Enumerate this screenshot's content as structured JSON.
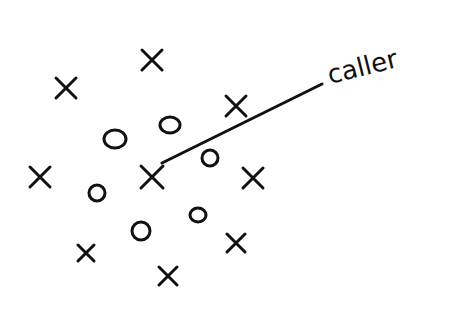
{
  "diagram": {
    "type": "hand-drawn play diagram",
    "label": "caller",
    "pointer_line": {
      "x1": 162,
      "y1": 163,
      "x2": 322,
      "y2": 84
    },
    "label_pos": {
      "x": 330,
      "y": 84,
      "rotate": -14
    },
    "x_marks": [
      {
        "x": 66,
        "y": 88,
        "s": 10
      },
      {
        "x": 152,
        "y": 60,
        "s": 10
      },
      {
        "x": 236,
        "y": 106,
        "s": 10
      },
      {
        "x": 40,
        "y": 177,
        "s": 10
      },
      {
        "x": 152,
        "y": 177,
        "s": 11
      },
      {
        "x": 253,
        "y": 178,
        "s": 10
      },
      {
        "x": 86,
        "y": 253,
        "s": 8
      },
      {
        "x": 236,
        "y": 243,
        "s": 9
      },
      {
        "x": 168,
        "y": 276,
        "s": 9
      }
    ],
    "o_marks": [
      {
        "x": 115,
        "y": 139,
        "rx": 11,
        "ry": 9
      },
      {
        "x": 170,
        "y": 125,
        "rx": 10,
        "ry": 8
      },
      {
        "x": 210,
        "y": 158,
        "rx": 8,
        "ry": 8
      },
      {
        "x": 97,
        "y": 193,
        "rx": 8,
        "ry": 8
      },
      {
        "x": 141,
        "y": 231,
        "rx": 9,
        "ry": 9
      },
      {
        "x": 198,
        "y": 215,
        "rx": 8,
        "ry": 7
      }
    ]
  }
}
